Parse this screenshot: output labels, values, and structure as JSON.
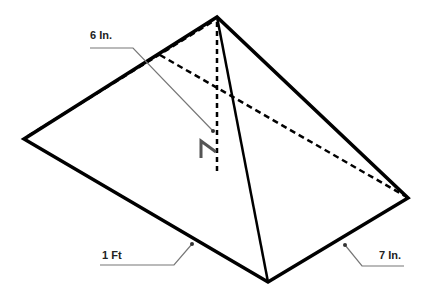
{
  "diagram": {
    "type": "pyramid",
    "labels": {
      "height": "6 In.",
      "base_left": "1 Ft",
      "base_right": "7 In."
    },
    "vertices": {
      "apex": [
        217,
        17
      ],
      "left": [
        24,
        139
      ],
      "bottom": [
        268,
        282
      ],
      "right": [
        408,
        198
      ],
      "hidden_back": [
        165,
        56
      ]
    },
    "colors": {
      "edge": "#000000",
      "leader": "#777777",
      "right_angle": "#555555"
    }
  }
}
